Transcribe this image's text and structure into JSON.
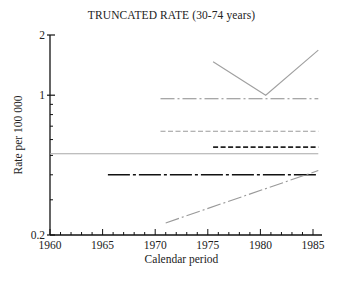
{
  "chart_data": {
    "type": "line",
    "title": "TRUNCATED RATE (30-74 years)",
    "xlabel": "Calendar period",
    "ylabel": "Rate per 100 000",
    "xlim": [
      1960,
      1986
    ],
    "ylim": [
      0.2,
      2
    ],
    "yscale": "log",
    "x_ticks": [
      1960,
      1965,
      1970,
      1975,
      1980,
      1985
    ],
    "y_ticks": [
      0.2,
      1,
      2
    ],
    "y_tick_labels": [
      "0.2",
      "1",
      "2"
    ],
    "grid": false,
    "legend": null,
    "series": [
      {
        "name": "gray-solid-v",
        "style": "solid",
        "color": "#a0a0a0",
        "x": [
          1975.5,
          1980.5,
          1985.5
        ],
        "y": [
          1.47,
          1.0,
          1.68
        ]
      },
      {
        "name": "gray-dash-dot-upper",
        "style": "dashdot",
        "color": "#8a8a8a",
        "x": [
          1970.5,
          1985.5
        ],
        "y": [
          0.96,
          0.96
        ]
      },
      {
        "name": "gray-dashed",
        "style": "dashed",
        "color": "#9a9a9a",
        "x": [
          1970.5,
          1985.5
        ],
        "y": [
          0.66,
          0.66
        ]
      },
      {
        "name": "black-dashed",
        "style": "dashed",
        "color": "#222222",
        "x": [
          1975.5,
          1985.5
        ],
        "y": [
          0.55,
          0.55
        ]
      },
      {
        "name": "gray-solid-flat",
        "style": "solid",
        "color": "#a8a8a8",
        "x": [
          1960,
          1985.5
        ],
        "y": [
          0.51,
          0.51
        ]
      },
      {
        "name": "black-long-dash-dot",
        "style": "longdashdot",
        "color": "#111111",
        "x": [
          1965.5,
          1985.5
        ],
        "y": [
          0.4,
          0.4
        ]
      },
      {
        "name": "gray-dash-dot-rising",
        "style": "dashdot",
        "color": "#999999",
        "x": [
          1971,
          1985.5
        ],
        "y": [
          0.23,
          0.42
        ]
      }
    ]
  },
  "labels": {
    "title": "TRUNCATED RATE (30-74 years)",
    "xlabel": "Calendar period",
    "ylabel": "Rate per 100 000"
  }
}
